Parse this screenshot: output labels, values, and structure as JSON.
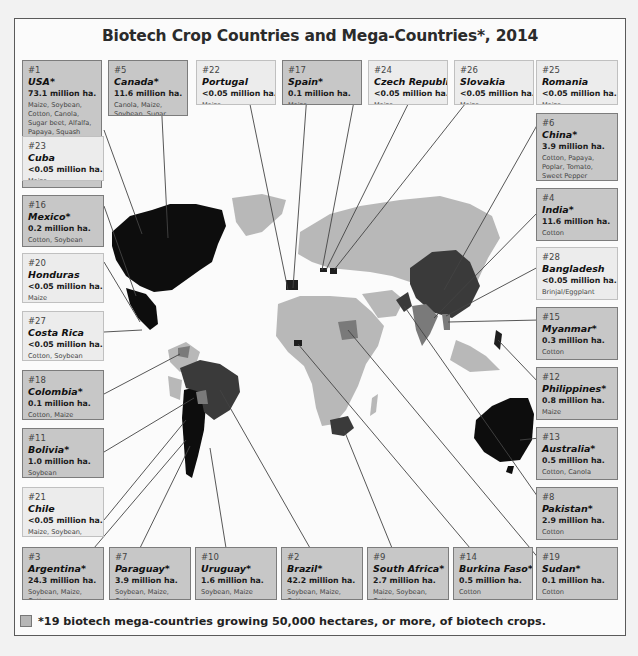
{
  "title": "Biotech Crop Countries and Mega-Countries*, 2014",
  "legend": {
    "swatch_color": "#b6b6b6",
    "text": "*19 biotech mega-countries growing 50,000 hectares, or more, of biotech crops."
  },
  "colors": {
    "mega_box": "#c7c7c7",
    "minor_box": "#ececec",
    "map_other": "#b8b8b8",
    "map_black": "#0d0d0d",
    "map_dark": "#3a3a3a",
    "map_mid": "#7a7a7a"
  },
  "countries": [
    {
      "rank": "#1",
      "name": "USA*",
      "area": "73.1 million ha.",
      "crops": "Maize, Soybean, Cotton, Canola, Sugar beet, Alfalfa, Papaya, Squash",
      "mega": true
    },
    {
      "rank": "#5",
      "name": "Canada*",
      "area": "11.6 million ha.",
      "crops": "Canola, Maize, Soybean, Sugar beet",
      "mega": true
    },
    {
      "rank": "#22",
      "name": "Portugal",
      "area": "<0.05 million ha.",
      "crops": "Maize",
      "mega": false
    },
    {
      "rank": "#17",
      "name": "Spain*",
      "area": "0.1 million ha.",
      "crops": "Maize",
      "mega": true
    },
    {
      "rank": "#24",
      "name": "Czech Republic",
      "area": "<0.05 million ha.",
      "crops": "Maize",
      "mega": false
    },
    {
      "rank": "#26",
      "name": "Slovakia",
      "area": "<0.05 million ha.",
      "crops": "Maize",
      "mega": false
    },
    {
      "rank": "#25",
      "name": "Romania",
      "area": "<0.05 million ha.",
      "crops": "Maize",
      "mega": false
    },
    {
      "rank": "#23",
      "name": "Cuba",
      "area": "<0.05 million ha.",
      "crops": "Maize",
      "mega": false
    },
    {
      "rank": "#16",
      "name": "Mexico*",
      "area": "0.2 million ha.",
      "crops": "Cotton, Soybean",
      "mega": true
    },
    {
      "rank": "#20",
      "name": "Honduras",
      "area": "<0.05 million ha.",
      "crops": "Maize",
      "mega": false
    },
    {
      "rank": "#27",
      "name": "Costa Rica",
      "area": "<0.05 million ha.",
      "crops": "Cotton, Soybean",
      "mega": false
    },
    {
      "rank": "#18",
      "name": "Colombia*",
      "area": "0.1 million ha.",
      "crops": "Cotton, Maize",
      "mega": true
    },
    {
      "rank": "#11",
      "name": "Bolivia*",
      "area": "1.0 million ha.",
      "crops": "Soybean",
      "mega": true
    },
    {
      "rank": "#21",
      "name": "Chile",
      "area": "<0.05 million ha.",
      "crops": "Maize, Soybean, Canola",
      "mega": false
    },
    {
      "rank": "#6",
      "name": "China*",
      "area": "3.9 million ha.",
      "crops": "Cotton, Papaya, Poplar, Tomato, Sweet Pepper",
      "mega": true
    },
    {
      "rank": "#4",
      "name": "India*",
      "area": "11.6 million ha.",
      "crops": "Cotton",
      "mega": true
    },
    {
      "rank": "#28",
      "name": "Bangladesh",
      "area": "<0.05 million ha.",
      "crops": "Brinjal/Eggplant",
      "mega": false
    },
    {
      "rank": "#15",
      "name": "Myanmar*",
      "area": "0.3 million ha.",
      "crops": "Cotton",
      "mega": true
    },
    {
      "rank": "#12",
      "name": "Philippines*",
      "area": "0.8 million ha.",
      "crops": "Maize",
      "mega": true
    },
    {
      "rank": "#13",
      "name": "Australia*",
      "area": "0.5 million ha.",
      "crops": "Cotton, Canola",
      "mega": true
    },
    {
      "rank": "#8",
      "name": "Pakistan*",
      "area": "2.9 million ha.",
      "crops": "Cotton",
      "mega": true
    },
    {
      "rank": "#3",
      "name": "Argentina*",
      "area": "24.3 million ha.",
      "crops": "Soybean, Maize, Cotton",
      "mega": true
    },
    {
      "rank": "#7",
      "name": "Paraguay*",
      "area": "3.9 million ha.",
      "crops": "Soybean, Maize, Cotton",
      "mega": true
    },
    {
      "rank": "#10",
      "name": "Uruguay*",
      "area": "1.6 million ha.",
      "crops": "Soybean, Maize",
      "mega": true
    },
    {
      "rank": "#2",
      "name": "Brazil*",
      "area": "42.2 million ha.",
      "crops": "Soybean, Maize, Cotton",
      "mega": true
    },
    {
      "rank": "#9",
      "name": "South Africa*",
      "area": "2.7 million ha.",
      "crops": "Maize, Soybean, Cotton",
      "mega": true
    },
    {
      "rank": "#14",
      "name": "Burkina Faso*",
      "area": "0.5 million ha.",
      "crops": "Cotton",
      "mega": true
    },
    {
      "rank": "#19",
      "name": "Sudan*",
      "area": "0.1 million ha.",
      "crops": "Cotton",
      "mega": true
    }
  ]
}
